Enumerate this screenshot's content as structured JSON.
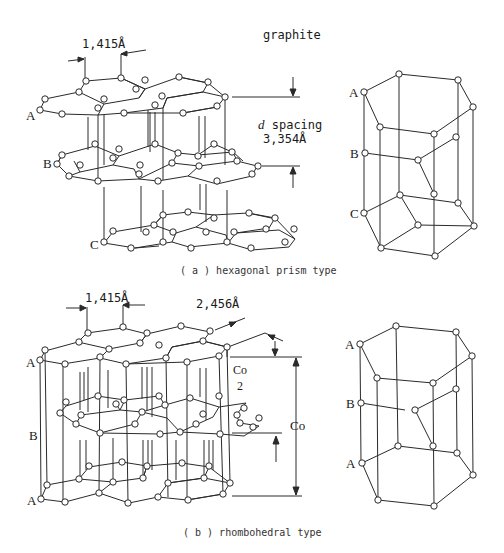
{
  "title": "graphite",
  "figure_a": {
    "caption": "( a ) hexagonal prism type",
    "bond_length": "1,415Å",
    "spacing_label_italic": "d",
    "spacing_label": " spacing",
    "spacing_value": "3,354Å",
    "layer_labels": [
      "A",
      "B",
      "C"
    ],
    "prism_labels": [
      "A",
      "B",
      "C"
    ]
  },
  "figure_b": {
    "caption": "( b ) rhombohedral type",
    "bond_length": "1,415Å",
    "lattice_constant": "2,456Å",
    "half_c_top": "Co",
    "half_c_bottom": "2",
    "c_label": "Co",
    "layer_labels": [
      "A",
      "B",
      "A"
    ],
    "prism_labels": [
      "A",
      "B",
      "A"
    ]
  },
  "colors": {
    "line": "#2a2a2a",
    "background": "#ffffff"
  }
}
